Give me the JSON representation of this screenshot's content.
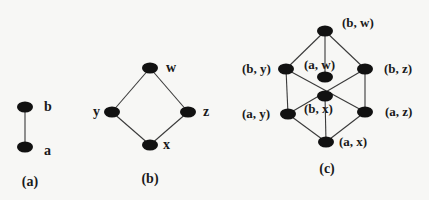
{
  "diagrams": [
    {
      "caption": "(a)",
      "nodes": [
        {
          "id": "b",
          "label": "b"
        },
        {
          "id": "a",
          "label": "a"
        }
      ],
      "edges": [
        [
          "b",
          "a"
        ]
      ]
    },
    {
      "caption": "(b)",
      "nodes": [
        {
          "id": "w",
          "label": "w"
        },
        {
          "id": "y",
          "label": "y"
        },
        {
          "id": "z",
          "label": "z"
        },
        {
          "id": "x",
          "label": "x"
        }
      ],
      "edges": [
        [
          "w",
          "y"
        ],
        [
          "w",
          "z"
        ],
        [
          "y",
          "x"
        ],
        [
          "z",
          "x"
        ]
      ]
    },
    {
      "caption": "(c)",
      "nodes": [
        {
          "id": "bw",
          "label": "(b, w)"
        },
        {
          "id": "by",
          "label": "(b, y)"
        },
        {
          "id": "aw",
          "label": "(a, w)"
        },
        {
          "id": "bz",
          "label": "(b, z)"
        },
        {
          "id": "bx",
          "label": "(b, x)"
        },
        {
          "id": "ay",
          "label": "(a, y)"
        },
        {
          "id": "az",
          "label": "(a, z)"
        },
        {
          "id": "ax",
          "label": "(a, x)"
        }
      ],
      "edges": [
        [
          "bw",
          "by"
        ],
        [
          "bw",
          "aw"
        ],
        [
          "bw",
          "bz"
        ],
        [
          "by",
          "ay"
        ],
        [
          "bz",
          "az"
        ],
        [
          "by",
          "az"
        ],
        [
          "bz",
          "ay"
        ],
        [
          "bx",
          "ax"
        ],
        [
          "ay",
          "ax"
        ],
        [
          "az",
          "ax"
        ]
      ]
    }
  ]
}
